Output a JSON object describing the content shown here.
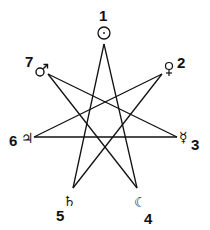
{
  "diagram": {
    "type": "heptagram {7/3}",
    "stroke_color": "#111111",
    "background": "#ffffff",
    "vertices": [
      {
        "number": "1",
        "symbol": "☉",
        "name": "Sun",
        "x": 104,
        "y": 44
      },
      {
        "number": "2",
        "symbol": "♀",
        "name": "Venus",
        "x": 162,
        "y": 74
      },
      {
        "number": "3",
        "symbol": "☿",
        "name": "Mercury",
        "x": 177,
        "y": 137
      },
      {
        "number": "4",
        "symbol": "☾",
        "name": "Moon",
        "x": 137,
        "y": 188
      },
      {
        "number": "5",
        "symbol": "♄",
        "name": "Saturn",
        "x": 73,
        "y": 188
      },
      {
        "number": "6",
        "symbol": "♃",
        "name": "Jupiter",
        "x": 34,
        "y": 137
      },
      {
        "number": "7",
        "symbol": "♂",
        "name": "Mars",
        "x": 48,
        "y": 74
      }
    ],
    "edges": [
      [
        1,
        4
      ],
      [
        4,
        7
      ],
      [
        7,
        3
      ],
      [
        3,
        6
      ],
      [
        6,
        2
      ],
      [
        2,
        5
      ],
      [
        5,
        1
      ]
    ]
  }
}
